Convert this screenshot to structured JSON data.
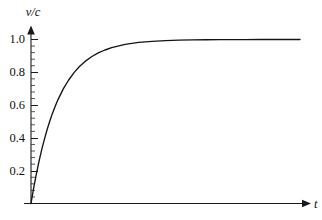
{
  "chart_data": {
    "type": "line",
    "title": "",
    "subtitle": "",
    "xlabel": "t",
    "ylabel": "v/c",
    "grid": false,
    "legend": null,
    "xlim": [
      0,
      10
    ],
    "ylim": [
      0,
      1.06
    ],
    "x_ticks": [],
    "x_tick_labels": [],
    "y_ticks": [
      0.2,
      0.4,
      0.6,
      0.8,
      1.0
    ],
    "y_tick_labels": [
      "0.2",
      "0.4",
      "0.6",
      "0.8",
      "1.0"
    ],
    "y_minor_tick_step": 0.04,
    "axis_style": "arrow-terminated",
    "asymptote": 1.0,
    "series": [
      {
        "name": "v/c",
        "description": "relativistic velocity approaching c",
        "x": [
          0.0,
          0.1,
          0.2,
          0.3,
          0.4,
          0.5,
          0.6,
          0.7,
          0.8,
          0.9,
          1.0,
          1.2,
          1.4,
          1.6,
          1.8,
          2.0,
          2.25,
          2.5,
          2.75,
          3.0,
          3.5,
          4.0,
          4.5,
          5.0,
          5.5,
          6.0,
          6.5,
          7.0,
          7.5,
          8.0,
          8.5,
          9.0,
          9.5,
          10.0
        ],
        "y": [
          0.0,
          0.095,
          0.181,
          0.259,
          0.33,
          0.393,
          0.451,
          0.503,
          0.551,
          0.593,
          0.632,
          0.699,
          0.753,
          0.798,
          0.835,
          0.865,
          0.895,
          0.918,
          0.936,
          0.95,
          0.97,
          0.982,
          0.989,
          0.993,
          0.996,
          0.998,
          0.9985,
          0.999,
          0.9994,
          0.9997,
          0.9998,
          0.9999,
          1.0,
          1.0
        ]
      }
    ],
    "colors": {
      "curve": "#141414",
      "axis": "#1a1a1a",
      "text": "#111111",
      "background": "#ffffff"
    }
  },
  "labels": {
    "y_axis_title": "v/c",
    "x_axis_title": "t",
    "y_tick_0": "0.2",
    "y_tick_1": "0.4",
    "y_tick_2": "0.6",
    "y_tick_3": "0.8",
    "y_tick_4": "1.0"
  }
}
